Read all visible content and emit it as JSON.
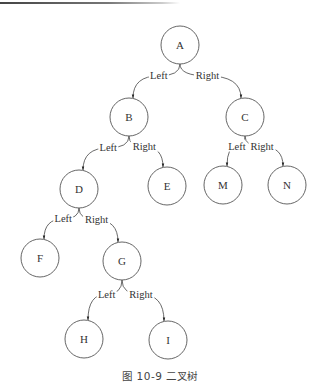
{
  "diagram": {
    "type": "binary-tree",
    "caption": "图 10-9    二叉树",
    "nodes": [
      {
        "id": "A",
        "label": "A",
        "x": 180,
        "y": 45
      },
      {
        "id": "B",
        "label": "B",
        "x": 129,
        "y": 117
      },
      {
        "id": "C",
        "label": "C",
        "x": 245,
        "y": 117
      },
      {
        "id": "D",
        "label": "D",
        "x": 79,
        "y": 189
      },
      {
        "id": "E",
        "label": "E",
        "x": 167,
        "y": 186
      },
      {
        "id": "M",
        "label": "M",
        "x": 223,
        "y": 185
      },
      {
        "id": "N",
        "label": "N",
        "x": 287,
        "y": 185
      },
      {
        "id": "F",
        "label": "F",
        "x": 40,
        "y": 258
      },
      {
        "id": "G",
        "label": "G",
        "x": 122,
        "y": 261
      },
      {
        "id": "H",
        "label": "H",
        "x": 84,
        "y": 339
      },
      {
        "id": "I",
        "label": "I",
        "x": 168,
        "y": 340
      }
    ],
    "edges": [
      {
        "from": "A",
        "to": "B",
        "label": "Left"
      },
      {
        "from": "A",
        "to": "C",
        "label": "Right"
      },
      {
        "from": "B",
        "to": "D",
        "label": "Left"
      },
      {
        "from": "B",
        "to": "E",
        "label": "Right"
      },
      {
        "from": "C",
        "to": "M",
        "label": "Left"
      },
      {
        "from": "C",
        "to": "N",
        "label": "Right"
      },
      {
        "from": "D",
        "to": "F",
        "label": "Left"
      },
      {
        "from": "D",
        "to": "G",
        "label": "Right"
      },
      {
        "from": "G",
        "to": "H",
        "label": "Left"
      },
      {
        "from": "G",
        "to": "I",
        "label": "Right"
      }
    ]
  }
}
